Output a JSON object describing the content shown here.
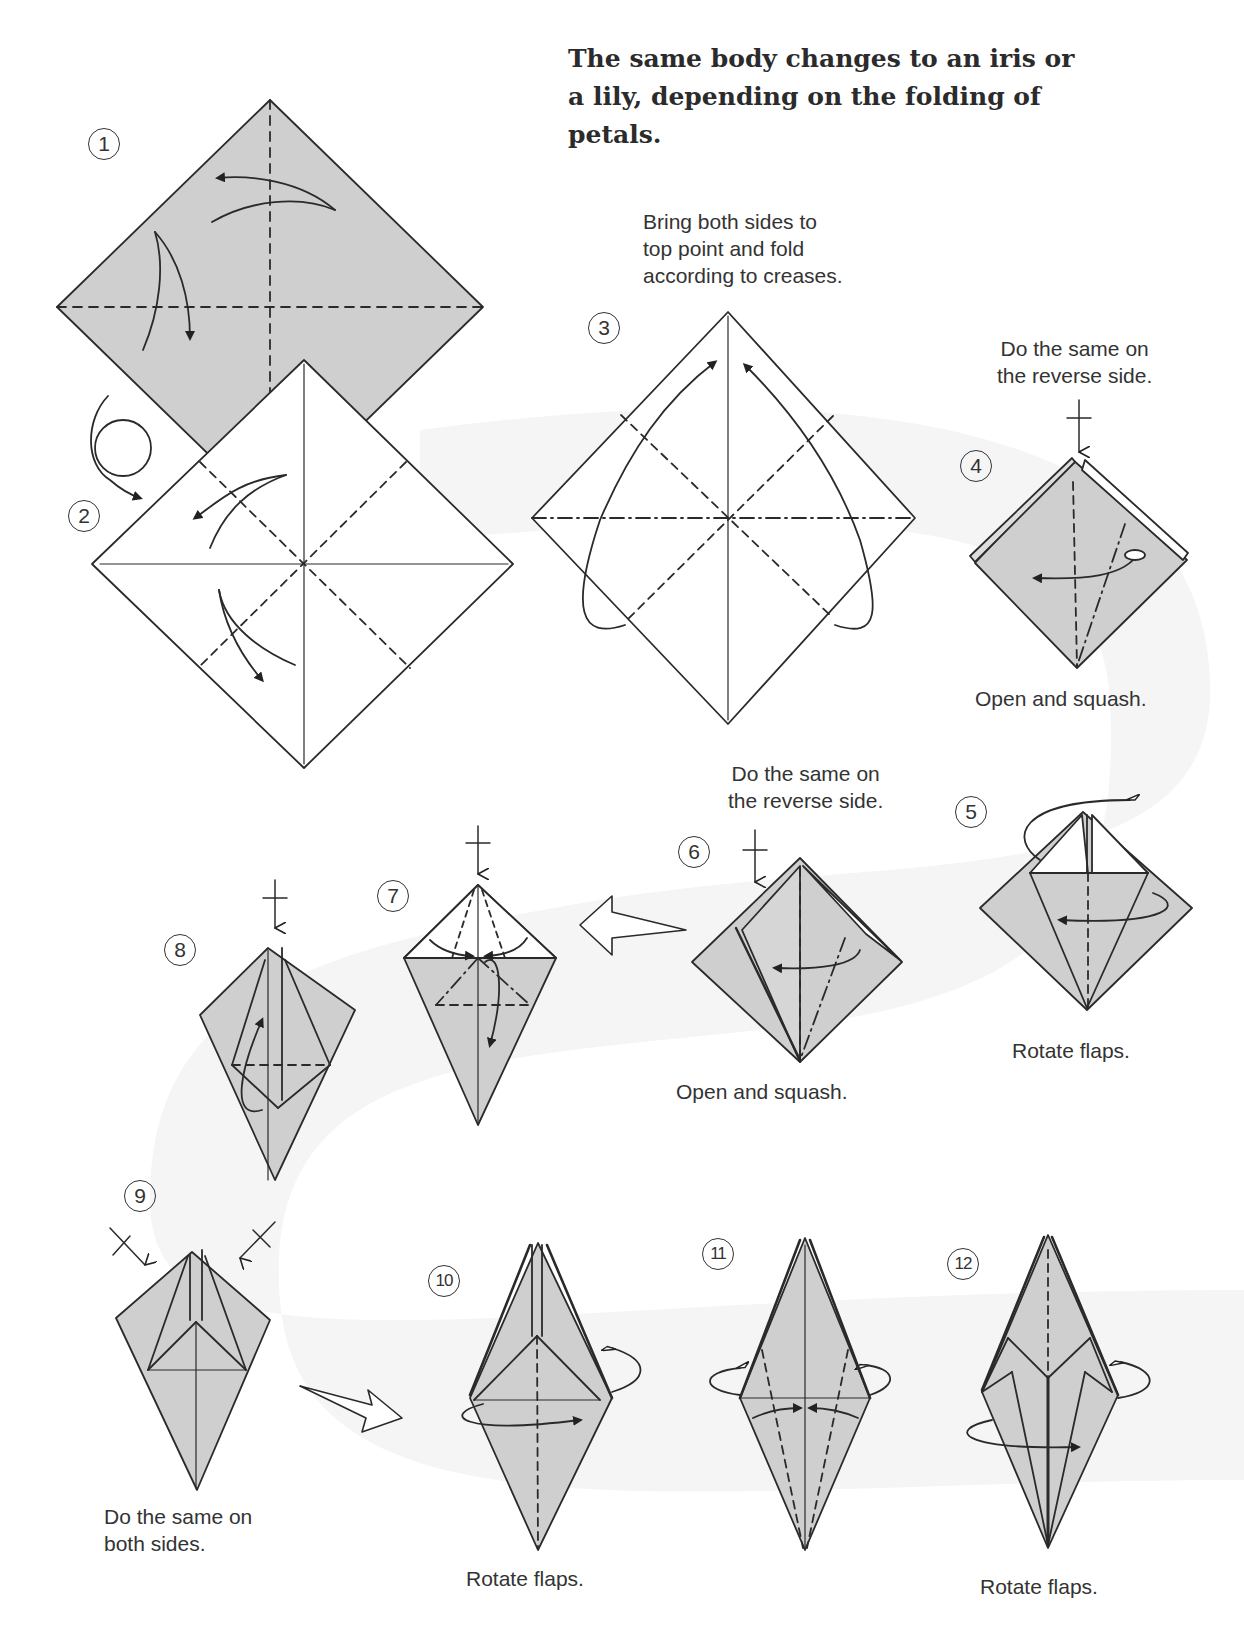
{
  "page": {
    "heading": "The same body changes to an iris or a lily, depending on the folding of petals.",
    "colors": {
      "paper_shaded": "#cfcfcf",
      "paper_white": "#ffffff",
      "line": "#2a2a2a",
      "background_band": "#f6f6f6"
    }
  },
  "steps": [
    {
      "number": "1",
      "caption": ""
    },
    {
      "number": "2",
      "caption": ""
    },
    {
      "number": "3",
      "caption": "Bring both sides to top point and fold according to creases."
    },
    {
      "number": "4",
      "caption_top": "Do the same on the reverse side.",
      "caption": "Open and squash."
    },
    {
      "number": "5",
      "caption": "Rotate flaps."
    },
    {
      "number": "6",
      "caption_top": "Do the same on the reverse side.",
      "caption": "Open and squash."
    },
    {
      "number": "7",
      "caption": ""
    },
    {
      "number": "8",
      "caption": ""
    },
    {
      "number": "9",
      "caption": "Do the same on both sides."
    },
    {
      "number": "10",
      "caption": "Rotate flaps."
    },
    {
      "number": "11",
      "caption": ""
    },
    {
      "number": "12",
      "caption": "Rotate flaps."
    }
  ],
  "captions": {
    "s3_line1": "Bring both sides to",
    "s3_line2": "top point and fold",
    "s3_line3": "according to creases.",
    "s4_top1": "Do the same on",
    "s4_top2": "the reverse side.",
    "s4_bottom": "Open and squash.",
    "s5_bottom": "Rotate flaps.",
    "s6_top1": "Do the same on",
    "s6_top2": "the reverse side.",
    "s6_bottom": "Open and squash.",
    "s9_line1": "Do the same on",
    "s9_line2": "both sides.",
    "s10_bottom": "Rotate flaps.",
    "s12_bottom": "Rotate flaps."
  },
  "icons": [
    "valley-fold-arrow",
    "mountain-fold-arrow",
    "turn-over-icon",
    "push-arrow-icon",
    "rotate-flap-arrow",
    "next-step-hollow-arrow"
  ]
}
